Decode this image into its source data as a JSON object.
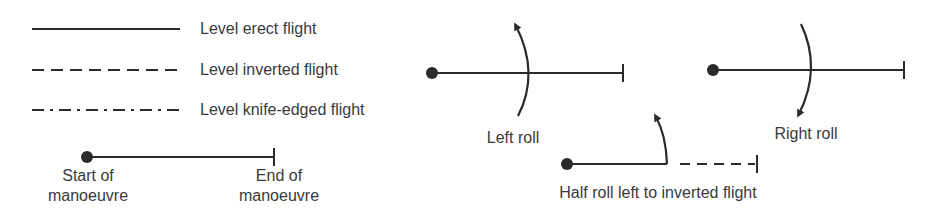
{
  "legend": {
    "items": [
      {
        "style": "solid",
        "label": "Level erect flight"
      },
      {
        "style": "dashed",
        "label": "Level inverted flight"
      },
      {
        "style": "dash-dot",
        "label": "Level knife-edged flight"
      }
    ],
    "start_label_1": "Start of",
    "start_label_2": "manoeuvre",
    "end_label_1": "End of",
    "end_label_2": "manoeuvre"
  },
  "examples": {
    "left_roll": "Left roll",
    "right_roll": "Right roll",
    "half_roll": "Half roll left to inverted flight"
  },
  "colors": {
    "ink": "#2a2a2a",
    "text": "#3a3a3a",
    "background": "#ffffff"
  }
}
